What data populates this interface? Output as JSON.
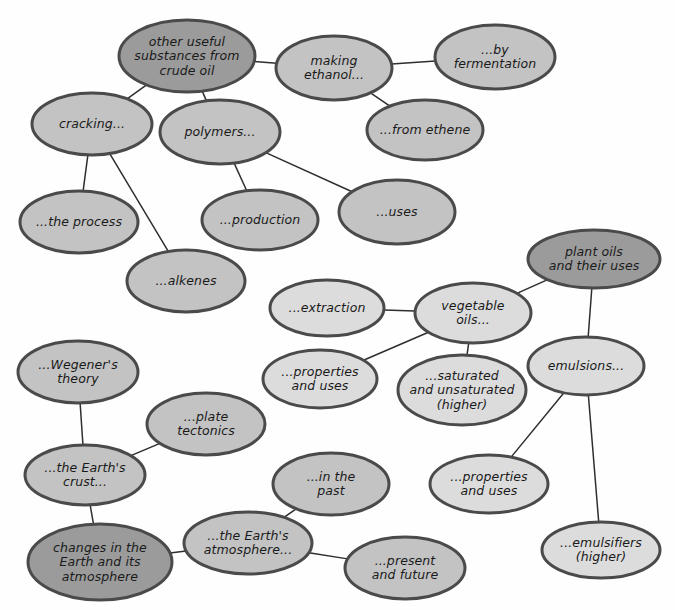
{
  "diagram": {
    "background_color": "#fefefe",
    "palette": {
      "node_dark": "#9b9b9b",
      "node_medium": "#c3c3c3",
      "node_light": "#dcdcdc",
      "node_border": "#4a4a4a",
      "edge_color": "#2e2e2e",
      "text_color": "#1a1a1a"
    },
    "nodes": [
      {
        "id": "crude-oil",
        "lines": [
          "other useful",
          "substances from",
          "crude oil"
        ],
        "cx": 187,
        "cy": 56,
        "rx": 68,
        "ry": 36,
        "shade": "node_dark",
        "role": "topic-root"
      },
      {
        "id": "making-ethanol",
        "lines": [
          "making",
          "ethanol..."
        ],
        "cx": 334,
        "cy": 68,
        "rx": 58,
        "ry": 32,
        "shade": "node_medium",
        "role": "sub-topic"
      },
      {
        "id": "by-fermentation",
        "lines": [
          "...by",
          "fermentation"
        ],
        "cx": 495,
        "cy": 57,
        "rx": 60,
        "ry": 32,
        "shade": "node_medium",
        "role": "sub-topic"
      },
      {
        "id": "from-ethene",
        "lines": [
          "...from ethene"
        ],
        "cx": 425,
        "cy": 130,
        "rx": 58,
        "ry": 30,
        "shade": "node_medium",
        "role": "sub-topic"
      },
      {
        "id": "cracking",
        "lines": [
          "cracking..."
        ],
        "cx": 92,
        "cy": 124,
        "rx": 60,
        "ry": 31,
        "shade": "node_medium",
        "role": "sub-topic"
      },
      {
        "id": "polymers",
        "lines": [
          "polymers..."
        ],
        "cx": 220,
        "cy": 132,
        "rx": 60,
        "ry": 32,
        "shade": "node_medium",
        "role": "sub-topic"
      },
      {
        "id": "the-process",
        "lines": [
          "...the process"
        ],
        "cx": 79,
        "cy": 222,
        "rx": 59,
        "ry": 31,
        "shade": "node_medium",
        "role": "sub-topic"
      },
      {
        "id": "alkenes",
        "lines": [
          "...alkenes"
        ],
        "cx": 186,
        "cy": 281,
        "rx": 59,
        "ry": 31,
        "shade": "node_medium",
        "role": "sub-topic"
      },
      {
        "id": "production",
        "lines": [
          "...production"
        ],
        "cx": 260,
        "cy": 220,
        "rx": 58,
        "ry": 30,
        "shade": "node_medium",
        "role": "sub-topic"
      },
      {
        "id": "uses",
        "lines": [
          "...uses"
        ],
        "cx": 397,
        "cy": 212,
        "rx": 58,
        "ry": 32,
        "shade": "node_medium",
        "role": "sub-topic"
      },
      {
        "id": "plant-oils",
        "lines": [
          "plant oils",
          "and their uses"
        ],
        "cx": 594,
        "cy": 259,
        "rx": 66,
        "ry": 29,
        "shade": "node_dark",
        "role": "topic-root"
      },
      {
        "id": "extraction",
        "lines": [
          "...extraction"
        ],
        "cx": 327,
        "cy": 308,
        "rx": 57,
        "ry": 28,
        "shade": "node_light",
        "role": "sub-topic"
      },
      {
        "id": "vegetable-oils",
        "lines": [
          "vegetable",
          "oils..."
        ],
        "cx": 473,
        "cy": 313,
        "rx": 58,
        "ry": 30,
        "shade": "node_light",
        "role": "sub-topic"
      },
      {
        "id": "emulsions",
        "lines": [
          "emulsions..."
        ],
        "cx": 586,
        "cy": 366,
        "rx": 58,
        "ry": 29,
        "shade": "node_light",
        "role": "sub-topic"
      },
      {
        "id": "oil-properties-uses",
        "lines": [
          "...properties",
          "and uses"
        ],
        "cx": 320,
        "cy": 379,
        "rx": 57,
        "ry": 29,
        "shade": "node_light",
        "role": "sub-topic"
      },
      {
        "id": "saturated-unsaturated",
        "lines": [
          "...saturated",
          "and unsaturated",
          "(higher)"
        ],
        "cx": 462,
        "cy": 390,
        "rx": 64,
        "ry": 35,
        "shade": "node_light",
        "role": "sub-topic"
      },
      {
        "id": "emulsion-properties-uses",
        "lines": [
          "...properties",
          "and uses"
        ],
        "cx": 489,
        "cy": 484,
        "rx": 59,
        "ry": 29,
        "shade": "node_light",
        "role": "sub-topic"
      },
      {
        "id": "emulsifiers",
        "lines": [
          "...emulsifiers",
          "(higher)"
        ],
        "cx": 601,
        "cy": 550,
        "rx": 59,
        "ry": 28,
        "shade": "node_light",
        "role": "sub-topic"
      },
      {
        "id": "wegener",
        "lines": [
          "...Wegener's",
          "theory"
        ],
        "cx": 78,
        "cy": 372,
        "rx": 60,
        "ry": 31,
        "shade": "node_medium",
        "role": "sub-topic"
      },
      {
        "id": "plate-tectonics",
        "lines": [
          "...plate",
          "tectonics"
        ],
        "cx": 206,
        "cy": 424,
        "rx": 59,
        "ry": 31,
        "shade": "node_medium",
        "role": "sub-topic"
      },
      {
        "id": "earths-crust",
        "lines": [
          "...the Earth's",
          "crust..."
        ],
        "cx": 85,
        "cy": 475,
        "rx": 60,
        "ry": 30,
        "shade": "node_medium",
        "role": "sub-topic"
      },
      {
        "id": "changes-earth",
        "lines": [
          "changes in the",
          "Earth and its",
          "atmosphere"
        ],
        "cx": 100,
        "cy": 562,
        "rx": 72,
        "ry": 38,
        "shade": "node_dark",
        "role": "topic-root"
      },
      {
        "id": "in-the-past",
        "lines": [
          "...in the",
          "past"
        ],
        "cx": 331,
        "cy": 484,
        "rx": 58,
        "ry": 31,
        "shade": "node_medium",
        "role": "sub-topic"
      },
      {
        "id": "earths-atmosphere",
        "lines": [
          "...the Earth's",
          "atmosphere..."
        ],
        "cx": 248,
        "cy": 543,
        "rx": 64,
        "ry": 31,
        "shade": "node_medium",
        "role": "sub-topic"
      },
      {
        "id": "present-future",
        "lines": [
          "...present",
          "and future"
        ],
        "cx": 405,
        "cy": 568,
        "rx": 60,
        "ry": 31,
        "shade": "node_medium",
        "role": "sub-topic"
      }
    ],
    "edges": [
      {
        "from": "crude-oil",
        "to": "making-ethanol"
      },
      {
        "from": "making-ethanol",
        "to": "by-fermentation"
      },
      {
        "from": "making-ethanol",
        "to": "from-ethene"
      },
      {
        "from": "crude-oil",
        "to": "cracking"
      },
      {
        "from": "crude-oil",
        "to": "polymers"
      },
      {
        "from": "cracking",
        "to": "the-process"
      },
      {
        "from": "cracking",
        "to": "alkenes"
      },
      {
        "from": "polymers",
        "to": "production"
      },
      {
        "from": "polymers",
        "to": "uses"
      },
      {
        "from": "plant-oils",
        "to": "vegetable-oils"
      },
      {
        "from": "plant-oils",
        "to": "emulsions"
      },
      {
        "from": "vegetable-oils",
        "to": "extraction"
      },
      {
        "from": "vegetable-oils",
        "to": "oil-properties-uses"
      },
      {
        "from": "vegetable-oils",
        "to": "saturated-unsaturated"
      },
      {
        "from": "emulsions",
        "to": "emulsion-properties-uses"
      },
      {
        "from": "emulsions",
        "to": "emulsifiers"
      },
      {
        "from": "wegener",
        "to": "earths-crust"
      },
      {
        "from": "plate-tectonics",
        "to": "earths-crust"
      },
      {
        "from": "earths-crust",
        "to": "changes-earth"
      },
      {
        "from": "changes-earth",
        "to": "earths-atmosphere"
      },
      {
        "from": "earths-atmosphere",
        "to": "in-the-past"
      },
      {
        "from": "earths-atmosphere",
        "to": "present-future"
      }
    ]
  }
}
